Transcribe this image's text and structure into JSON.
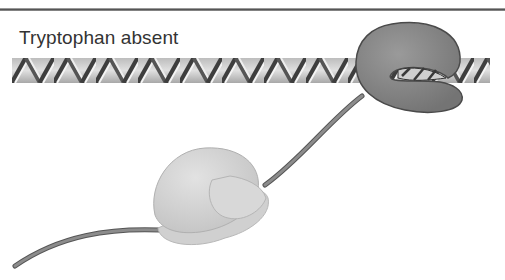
{
  "figure": {
    "caption": "Tryptophan absent",
    "elements": {
      "dna": "DNA double helix (operator region)",
      "repressor": "Repressor protein (inactive) with DNA passing through",
      "mrna": "mRNA strand",
      "ribosome": "Ribosome translating mRNA"
    },
    "colors": {
      "repressor": "#8a8a8a",
      "ribosome": "#d4d4d4",
      "mrna": "#7a7a7a",
      "dna_light": "#d8d8d8",
      "dna_dark": "#4a4a4a",
      "rule": "#666666"
    }
  }
}
